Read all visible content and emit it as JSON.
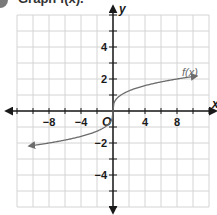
{
  "header": {
    "title": "Graph f(x)."
  },
  "chart_data": {
    "type": "line",
    "title": "Graph f(x).",
    "xlabel": "x",
    "ylabel": "y",
    "xlim": [
      -12,
      12
    ],
    "ylim": [
      -6,
      6
    ],
    "grid": true,
    "x_ticks": [
      -8,
      -4,
      4,
      8
    ],
    "y_ticks": [
      -4,
      -2,
      2,
      4
    ],
    "origin_label": "O",
    "series": [
      {
        "name": "f(x)",
        "function": "cube root of x",
        "x": [
          -10.5,
          -8,
          -4,
          -1,
          0,
          1,
          4,
          8,
          10.5
        ],
        "values": [
          -2.19,
          -2,
          -1.59,
          -1,
          0,
          1,
          1.59,
          2,
          2.19
        ],
        "arrows": "both ends"
      }
    ],
    "legend": {
      "label": "f(x)",
      "position": "upper right near curve"
    }
  },
  "colors": {
    "grid": "#d4d4d4",
    "axis": "#1a1a1a",
    "curve": "#6b6b6b"
  }
}
